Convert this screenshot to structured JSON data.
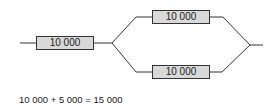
{
  "diagram": {
    "type": "resistor-network",
    "resistors": [
      {
        "id": "series",
        "label": "10 000"
      },
      {
        "id": "parallel-top",
        "label": "10 000"
      },
      {
        "id": "parallel-bottom",
        "label": "10 000"
      }
    ],
    "equation": "10 000 + 5 000 = 15 000"
  }
}
